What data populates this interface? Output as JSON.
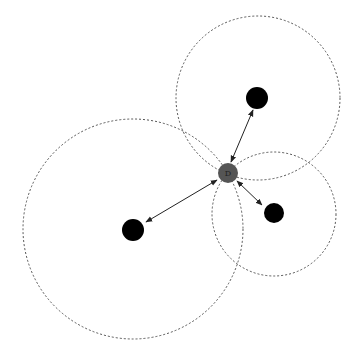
{
  "diagram": {
    "type": "node-range-diagram",
    "center_node": {
      "label": "D",
      "cx": 228,
      "cy": 173,
      "r": 10,
      "color": "#555555"
    },
    "nodes": [
      {
        "id": "top",
        "cx": 257,
        "cy": 98,
        "r": 11,
        "range": {
          "cx": 258,
          "cy": 98,
          "r": 82
        }
      },
      {
        "id": "left",
        "cx": 133,
        "cy": 230,
        "r": 11,
        "range": {
          "cx": 133,
          "cy": 229,
          "r": 110
        }
      },
      {
        "id": "right",
        "cx": 274,
        "cy": 213,
        "r": 10,
        "range": {
          "cx": 274,
          "cy": 214,
          "r": 62
        }
      }
    ],
    "edges": [
      {
        "from": "D",
        "to": "top",
        "style": "double-arrow"
      },
      {
        "from": "D",
        "to": "left",
        "style": "double-arrow"
      },
      {
        "from": "D",
        "to": "right",
        "style": "double-arrow"
      }
    ]
  }
}
